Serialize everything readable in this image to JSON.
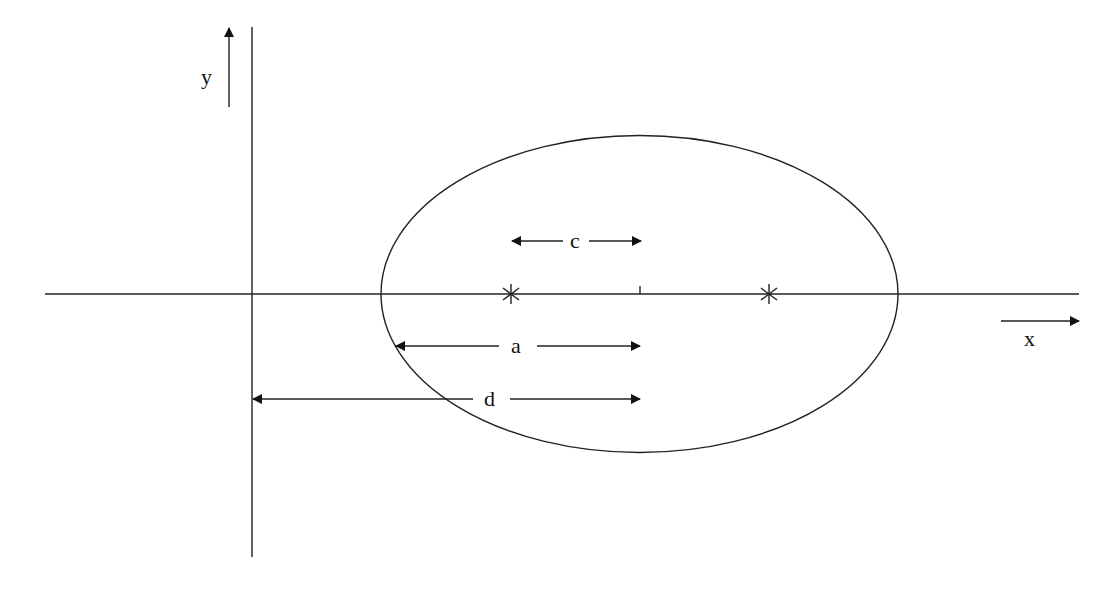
{
  "diagram": {
    "title": "",
    "stroke_color": "#222222",
    "background": "#ffffff",
    "axes": {
      "x_axis": {
        "from": [
          45,
          294
        ],
        "to": [
          1079,
          294
        ]
      },
      "y_axis": {
        "from": [
          252,
          27
        ],
        "to": [
          252,
          557
        ]
      },
      "x_label": "x",
      "y_label": "y",
      "x_direction_arrow": {
        "from": [
          1001,
          321
        ],
        "to": [
          1079,
          321
        ]
      },
      "y_direction_arrow": {
        "from": [
          229,
          107
        ],
        "to": [
          229,
          27
        ]
      }
    },
    "ellipse": {
      "cx": 639.5,
      "cy": 294,
      "rx": 258.5,
      "ry": 158.5
    },
    "center_tick": {
      "x": 640,
      "y1": 287,
      "y2": 294
    },
    "foci": [
      {
        "name": "left-focus",
        "x": 511,
        "y": 294,
        "marker": "asterisk"
      },
      {
        "name": "right-focus",
        "x": 769,
        "y": 294,
        "marker": "asterisk"
      }
    ],
    "dimensions": [
      {
        "name": "c",
        "label": "c",
        "y": 241,
        "x_start": 511,
        "x_end": 641,
        "gap": [
          563,
          589
        ],
        "label_x": 578
      },
      {
        "name": "a",
        "label": "a",
        "y": 346,
        "x_start": 396,
        "x_end": 640,
        "gap": [
          499,
          537
        ],
        "label_x": 518
      },
      {
        "name": "d",
        "label": "d",
        "y": 399,
        "x_start": 253,
        "x_end": 640,
        "gap": [
          473,
          510
        ],
        "label_x": 491
      }
    ]
  }
}
